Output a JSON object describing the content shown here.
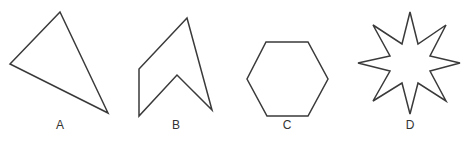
{
  "figure": {
    "stroke_color": "#3a3a3a",
    "background": "#ffffff"
  },
  "shapes": [
    {
      "label": "A",
      "kind": "triangle",
      "points": "60,12 10,64 108,113",
      "label_x": 60,
      "label_y": 129
    },
    {
      "label": "B",
      "kind": "concave pentagon (arrowhead)",
      "points": "187,18 139,69 139,116 177,75 212,110",
      "label_x": 176,
      "label_y": 129
    },
    {
      "label": "C",
      "kind": "hexagon",
      "points": "266,42 308,42 328,79 308,116 267,116 247,79",
      "label_x": 287,
      "label_y": 129
    },
    {
      "label": "D",
      "kind": "8-pointed star",
      "points": "410,12 418,44 446,25 430,56 460,63 430,71 446,101 418,83 410,114 402,83 373,101 390,71 358,63 390,56 373,25 402,44",
      "label_x": 410,
      "label_y": 129
    }
  ]
}
